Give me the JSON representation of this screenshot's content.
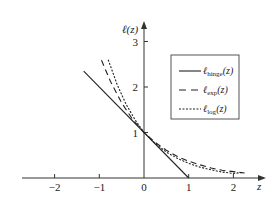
{
  "chart_data": {
    "type": "line",
    "title": "",
    "xlabel": "z",
    "ylabel": "ℓ(z)",
    "xlim": [
      -2.7,
      2.7
    ],
    "ylim": [
      0,
      3.4
    ],
    "grid": false,
    "legend_position": "top-right",
    "x_ticks": [
      {
        "value": -2,
        "label": "−2"
      },
      {
        "value": -1,
        "label": "−1"
      },
      {
        "value": 0,
        "label": "0"
      },
      {
        "value": 1,
        "label": "1"
      },
      {
        "value": 2,
        "label": "2"
      }
    ],
    "y_ticks": [
      {
        "value": 1,
        "label": "1"
      },
      {
        "value": 2,
        "label": "2"
      },
      {
        "value": 3,
        "label": "3"
      }
    ],
    "series": [
      {
        "name": "hinge",
        "legend_main": "ℓ",
        "legend_sub": "hinge",
        "legend_tail": "(z)",
        "style": "solid",
        "x": [
          -1.35,
          1.0
        ],
        "y": [
          2.35,
          0.0
        ]
      },
      {
        "name": "exp",
        "legend_main": "ℓ",
        "legend_sub": "exp",
        "legend_tail": "(z)",
        "style": "dashed",
        "x": [
          -0.95,
          -0.75,
          -0.5,
          -0.25,
          0.0,
          0.25,
          0.5,
          0.75,
          1.0,
          1.25,
          1.5,
          1.75,
          2.0,
          2.25
        ],
        "y": [
          2.59,
          2.12,
          1.65,
          1.28,
          1.0,
          0.78,
          0.61,
          0.47,
          0.37,
          0.29,
          0.22,
          0.17,
          0.14,
          0.11
        ]
      },
      {
        "name": "log",
        "legend_main": "ℓ",
        "legend_sub": "log",
        "legend_tail": "(z)",
        "style": "dotted",
        "x": [
          -0.8,
          -0.6,
          -0.4,
          -0.2,
          0.0,
          0.25,
          0.5,
          0.75,
          1.0,
          1.25,
          1.5,
          1.75,
          2.0,
          2.2
        ],
        "y": [
          2.6,
          2.05,
          1.62,
          1.28,
          1.0,
          0.76,
          0.57,
          0.43,
          0.32,
          0.24,
          0.18,
          0.13,
          0.1,
          0.12
        ]
      }
    ]
  }
}
